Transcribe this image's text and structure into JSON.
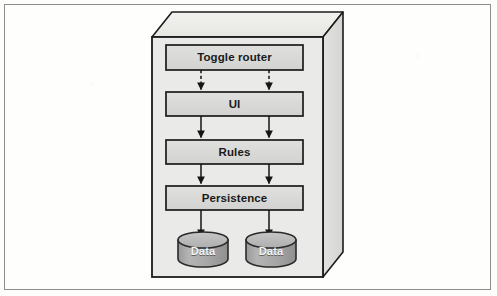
{
  "figure": {
    "type": "block-diagram",
    "frame": {
      "border_color": "#8d8d8d",
      "background": "#fefefd"
    }
  },
  "container": {
    "name": "deployment-box",
    "fill": "#e9e9e7",
    "top_face_fill": "#eeeeec",
    "side_face_fill": "#dedede",
    "stroke": "#1c1c1c"
  },
  "layers": [
    {
      "id": "toggle-router",
      "label": "Toggle router",
      "fill": "#d9d9d9",
      "stroke": "#1c1c1c"
    },
    {
      "id": "ui",
      "label": "UI",
      "fill": "#d9d9d9",
      "stroke": "#1c1c1c"
    },
    {
      "id": "rules",
      "label": "Rules",
      "fill": "#d9d9d9",
      "stroke": "#1c1c1c"
    },
    {
      "id": "persistence",
      "label": "Persistence",
      "fill": "#d9d9d9",
      "stroke": "#1c1c1c"
    }
  ],
  "datastores": [
    {
      "id": "data-left",
      "label": "Data",
      "fill": "#a9a9a9",
      "top_fill": "#bdbdbd",
      "stroke": "#2a2a2a"
    },
    {
      "id": "data-right",
      "label": "Data",
      "fill": "#a9a9a9",
      "top_fill": "#bdbdbd",
      "stroke": "#2a2a2a"
    }
  ],
  "connections": [
    {
      "from": "toggle-router",
      "to": "ui",
      "style": "dashed",
      "count": 2,
      "arrowhead": "filled-triangle"
    },
    {
      "from": "ui",
      "to": "rules",
      "style": "solid",
      "count": 2,
      "arrowhead": "filled-triangle"
    },
    {
      "from": "rules",
      "to": "persistence",
      "style": "solid",
      "count": 2,
      "arrowhead": "filled-triangle"
    },
    {
      "from": "persistence",
      "to": "datastores",
      "style": "solid",
      "count": 2,
      "arrowhead": "filled-triangle"
    }
  ],
  "geometry": {
    "box": {
      "front": {
        "x": 152,
        "y": 37,
        "w": 171,
        "h": 240
      },
      "depth_dx": 20,
      "depth_dy": -25
    },
    "layer_x": 166,
    "layer_w": 137,
    "layer_rows": [
      {
        "y": 45,
        "h": 25
      },
      {
        "y": 92,
        "h": 24
      },
      {
        "y": 140,
        "h": 24
      },
      {
        "y": 186,
        "h": 24
      }
    ],
    "arrow_columns": [
      201,
      269
    ],
    "cylinders": [
      {
        "cx": 203,
        "cy": 248,
        "rx": 25,
        "ry": 8,
        "body_h": 28
      },
      {
        "cx": 271,
        "cy": 248,
        "rx": 25,
        "ry": 8,
        "body_h": 28
      }
    ]
  }
}
